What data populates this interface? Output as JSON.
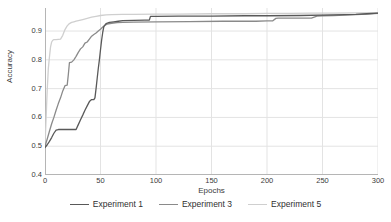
{
  "chart_data": {
    "type": "line",
    "title": "",
    "xlabel": "Epochs",
    "ylabel": "Accuracy",
    "xlim": [
      0,
      300
    ],
    "ylim": [
      0.4,
      0.98
    ],
    "xticks": [
      0,
      50,
      100,
      150,
      200,
      250,
      300
    ],
    "yticks": [
      0.4,
      0.5,
      0.6,
      0.7,
      0.8,
      0.9
    ],
    "xtick_labels": [
      "0",
      "50",
      "100",
      "150",
      "200",
      "250",
      "300"
    ],
    "ytick_labels": [
      "0.4",
      "0.5",
      "0.6",
      "0.7",
      "0.8",
      "0.9"
    ],
    "grid": true,
    "legend_position": "bottom",
    "series": [
      {
        "name": "Experiment 1",
        "color": "#595959",
        "x": [
          0,
          2,
          4,
          6,
          8,
          10,
          12,
          14,
          16,
          20,
          24,
          28,
          30,
          32,
          34,
          36,
          38,
          40,
          42,
          44,
          45,
          46,
          47,
          48,
          49,
          50,
          51,
          52,
          53,
          55,
          58,
          62,
          66,
          70,
          80,
          90,
          94,
          95,
          100,
          120,
          150,
          180,
          200,
          230,
          260,
          280,
          290,
          300
        ],
        "y": [
          0.495,
          0.505,
          0.517,
          0.53,
          0.545,
          0.556,
          0.558,
          0.558,
          0.558,
          0.558,
          0.558,
          0.558,
          0.575,
          0.592,
          0.608,
          0.625,
          0.64,
          0.655,
          0.662,
          0.662,
          0.668,
          0.7,
          0.735,
          0.77,
          0.8,
          0.835,
          0.868,
          0.895,
          0.915,
          0.926,
          0.93,
          0.932,
          0.934,
          0.936,
          0.937,
          0.938,
          0.938,
          0.951,
          0.951,
          0.952,
          0.952,
          0.953,
          0.953,
          0.954,
          0.956,
          0.958,
          0.96,
          0.962
        ]
      },
      {
        "name": "Experiment 3",
        "color": "#8a8a8a",
        "x": [
          0,
          2,
          4,
          6,
          8,
          10,
          12,
          14,
          16,
          18,
          20,
          21,
          22,
          24,
          26,
          28,
          30,
          32,
          34,
          36,
          38,
          40,
          42,
          44,
          46,
          48,
          50,
          52,
          54,
          56,
          60,
          65,
          70,
          80,
          100,
          130,
          160,
          190,
          200,
          205,
          208,
          210,
          215,
          220,
          230,
          240,
          245,
          250,
          260,
          275,
          290,
          300
        ],
        "y": [
          0.5,
          0.525,
          0.552,
          0.578,
          0.6,
          0.625,
          0.648,
          0.668,
          0.692,
          0.71,
          0.712,
          0.748,
          0.79,
          0.792,
          0.8,
          0.812,
          0.826,
          0.838,
          0.845,
          0.858,
          0.862,
          0.872,
          0.882,
          0.888,
          0.893,
          0.9,
          0.906,
          0.914,
          0.92,
          0.924,
          0.927,
          0.929,
          0.93,
          0.931,
          0.932,
          0.933,
          0.934,
          0.934,
          0.935,
          0.935,
          0.944,
          0.945,
          0.945,
          0.945,
          0.945,
          0.945,
          0.952,
          0.953,
          0.954,
          0.956,
          0.959,
          0.961
        ]
      },
      {
        "name": "Experiment 5",
        "color": "#cfcfcf",
        "x": [
          0,
          1,
          2,
          3,
          4,
          5,
          6,
          7,
          8,
          9,
          10,
          12,
          14,
          16,
          18,
          20,
          22,
          24,
          26,
          28,
          30,
          34,
          38,
          42,
          46,
          50,
          55,
          60,
          70,
          80,
          100,
          120,
          150,
          180,
          200,
          220,
          240,
          260,
          280,
          300
        ],
        "y": [
          0.5,
          0.6,
          0.695,
          0.77,
          0.81,
          0.845,
          0.862,
          0.868,
          0.87,
          0.87,
          0.87,
          0.871,
          0.872,
          0.885,
          0.905,
          0.918,
          0.926,
          0.93,
          0.932,
          0.934,
          0.936,
          0.94,
          0.944,
          0.948,
          0.951,
          0.954,
          0.956,
          0.957,
          0.958,
          0.958,
          0.959,
          0.959,
          0.96,
          0.96,
          0.961,
          0.961,
          0.962,
          0.962,
          0.963,
          0.964
        ]
      }
    ]
  },
  "axes": {
    "xlabel": "Epochs",
    "ylabel": "Accuracy"
  },
  "legend": {
    "items": [
      {
        "label": "Experiment 1",
        "color": "#595959"
      },
      {
        "label": "Experiment 3",
        "color": "#8a8a8a"
      },
      {
        "label": "Experiment 5",
        "color": "#cfcfcf"
      }
    ]
  },
  "style": {
    "grid_color": "#e3e3e3",
    "axis_color": "#b5b5b5",
    "background": "#ffffff",
    "text_color": "#3b3b3b"
  }
}
